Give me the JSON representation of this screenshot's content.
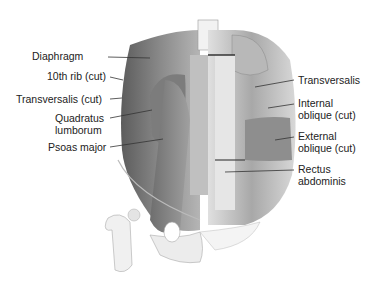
{
  "figure": {
    "colors": {
      "muscle_dark": "#6a6a6a",
      "muscle_mid": "#9a9a9a",
      "muscle_light": "#c8c8c8",
      "bone": "#ececec",
      "line": "#333333",
      "text": "#222222"
    },
    "labels_left": [
      {
        "text": "Diaphragm",
        "x": 32,
        "y": 50
      },
      {
        "text": "10th rib (cut)",
        "x": 18,
        "y": 70
      },
      {
        "text": "Transversalis (cut)",
        "x": 4,
        "y": 95
      },
      {
        "text": "Quadratus",
        "x": 42,
        "y": 115
      },
      {
        "text": "lumborum",
        "x": 46,
        "y": 127
      },
      {
        "text": "Psoas major",
        "x": 30,
        "y": 143
      }
    ],
    "labels_right": [
      {
        "text": "Transversalis",
        "x": 297,
        "y": 73
      },
      {
        "text": "Internal",
        "x": 297,
        "y": 97
      },
      {
        "text": "oblique (cut)",
        "x": 297,
        "y": 109
      },
      {
        "text": "External",
        "x": 297,
        "y": 131
      },
      {
        "text": "oblique (cut)",
        "x": 297,
        "y": 143
      },
      {
        "text": "Rectus",
        "x": 297,
        "y": 164
      },
      {
        "text": "abdominis",
        "x": 297,
        "y": 176
      }
    ]
  }
}
